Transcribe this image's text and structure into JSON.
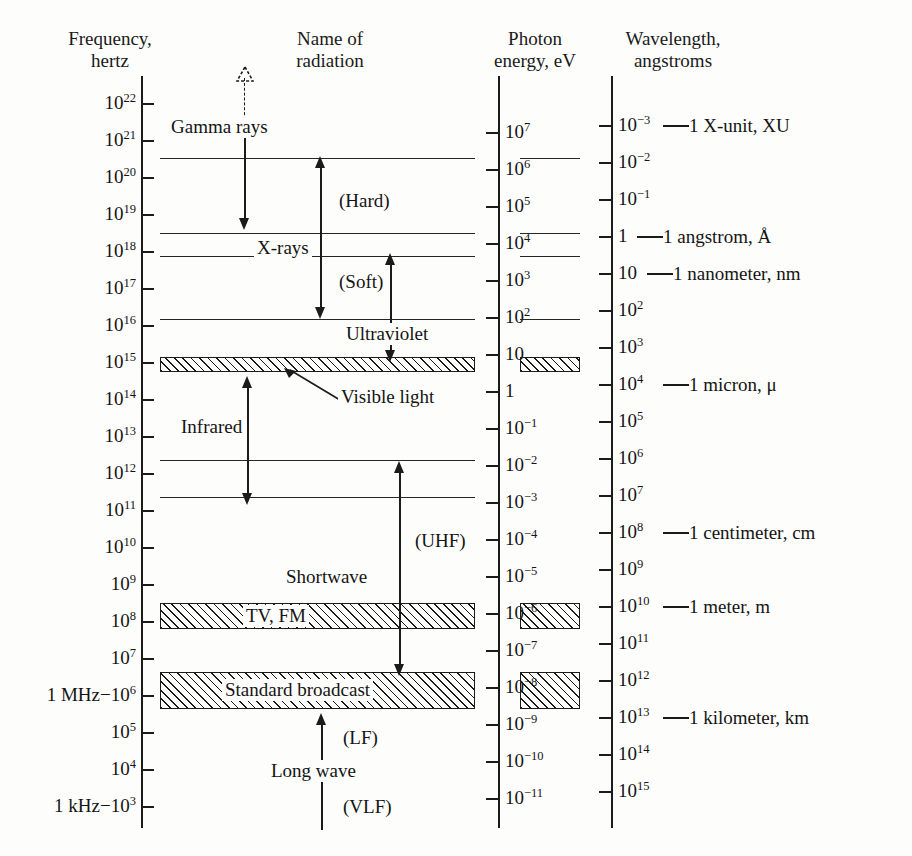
{
  "figure": {
    "background_color": "#fdfdfb",
    "ink_color": "#1b1b1b"
  },
  "columns": {
    "frequency": {
      "line1": "Frequency,",
      "line2": "hertz"
    },
    "name": {
      "line1": "Name of",
      "line2": "radiation"
    },
    "photon": {
      "line1": "Photon",
      "line2": "energy, eV"
    },
    "wavelength": {
      "line1": "Wavelength,",
      "line2": "angstroms"
    }
  },
  "frequency_axis": {
    "ticks": [
      {
        "label": "10",
        "exp": "22",
        "decade": 22
      },
      {
        "label": "10",
        "exp": "21",
        "decade": 21
      },
      {
        "label": "10",
        "exp": "20",
        "decade": 20
      },
      {
        "label": "10",
        "exp": "19",
        "decade": 19
      },
      {
        "label": "10",
        "exp": "18",
        "decade": 18
      },
      {
        "label": "10",
        "exp": "17",
        "decade": 17
      },
      {
        "label": "10",
        "exp": "16",
        "decade": 16
      },
      {
        "label": "10",
        "exp": "15",
        "decade": 15
      },
      {
        "label": "10",
        "exp": "14",
        "decade": 14
      },
      {
        "label": "10",
        "exp": "13",
        "decade": 13
      },
      {
        "label": "10",
        "exp": "12",
        "decade": 12
      },
      {
        "label": "10",
        "exp": "11",
        "decade": 11
      },
      {
        "label": "10",
        "exp": "10",
        "decade": 10
      },
      {
        "label": "10",
        "exp": "9",
        "decade": 9
      },
      {
        "label": "10",
        "exp": "8",
        "decade": 8
      },
      {
        "label": "10",
        "exp": "7",
        "decade": 7
      },
      {
        "label": "1 MHz−10",
        "exp": "6",
        "decade": 6
      },
      {
        "label": "10",
        "exp": "5",
        "decade": 5
      },
      {
        "label": "10",
        "exp": "4",
        "decade": 4
      },
      {
        "label": "1 kHz−10",
        "exp": "3",
        "decade": 3
      }
    ]
  },
  "photon_axis": {
    "ticks": [
      {
        "label": "10",
        "exp": "7"
      },
      {
        "label": "10",
        "exp": "6"
      },
      {
        "label": "10",
        "exp": "5"
      },
      {
        "label": "10",
        "exp": "4"
      },
      {
        "label": "10",
        "exp": "3"
      },
      {
        "label": "10",
        "exp": "2"
      },
      {
        "label": "10",
        "exp": ""
      },
      {
        "label": "1",
        "exp": ""
      },
      {
        "label": "10",
        "exp": "−1"
      },
      {
        "label": "10",
        "exp": "−2"
      },
      {
        "label": "10",
        "exp": "−3"
      },
      {
        "label": "10",
        "exp": "−4"
      },
      {
        "label": "10",
        "exp": "−5"
      },
      {
        "label": "10",
        "exp": "−6"
      },
      {
        "label": "10",
        "exp": "−7"
      },
      {
        "label": "10",
        "exp": "−8"
      },
      {
        "label": "10",
        "exp": "−9"
      },
      {
        "label": "10",
        "exp": "−10"
      },
      {
        "label": "10",
        "exp": "−11"
      }
    ]
  },
  "wavelength_axis": {
    "ticks": [
      {
        "label": "10",
        "exp": "−3",
        "unit": "1 X-unit, XU"
      },
      {
        "label": "10",
        "exp": "−2",
        "unit": ""
      },
      {
        "label": "10",
        "exp": "−1",
        "unit": ""
      },
      {
        "label": "1",
        "exp": "",
        "unit": "1 angstrom, Å"
      },
      {
        "label": "10",
        "exp": "",
        "unit": "1 nanometer, nm"
      },
      {
        "label": "10",
        "exp": "2",
        "unit": ""
      },
      {
        "label": "10",
        "exp": "3",
        "unit": ""
      },
      {
        "label": "10",
        "exp": "4",
        "unit": "1 micron, μ"
      },
      {
        "label": "10",
        "exp": "5",
        "unit": ""
      },
      {
        "label": "10",
        "exp": "6",
        "unit": ""
      },
      {
        "label": "10",
        "exp": "7",
        "unit": ""
      },
      {
        "label": "10",
        "exp": "8",
        "unit": "1 centimeter, cm"
      },
      {
        "label": "10",
        "exp": "9",
        "unit": ""
      },
      {
        "label": "10",
        "exp": "10",
        "unit": "1 meter, m"
      },
      {
        "label": "10",
        "exp": "11",
        "unit": ""
      },
      {
        "label": "10",
        "exp": "12",
        "unit": ""
      },
      {
        "label": "10",
        "exp": "13",
        "unit": "1 kilometer, km"
      },
      {
        "label": "10",
        "exp": "14",
        "unit": ""
      },
      {
        "label": "10",
        "exp": "15",
        "unit": ""
      }
    ]
  },
  "radiation_labels": {
    "gamma": "Gamma rays",
    "hard": "(Hard)",
    "xrays": "X-rays",
    "soft": "(Soft)",
    "ultraviolet": "Ultraviolet",
    "visible": "Visible light",
    "infrared": "Infrared",
    "uhf": "(UHF)",
    "shortwave": "Shortwave",
    "tvfm": "TV, FM",
    "broadcast": "Standard broadcast",
    "lf": "(LF)",
    "longwave": "Long wave",
    "vlf": "(VLF)"
  },
  "chart_data": {
    "type": "table",
    "axes": [
      {
        "name": "Frequency",
        "unit": "hertz",
        "range_log10": [
          3,
          22
        ],
        "direction": "high at top"
      },
      {
        "name": "Photon energy",
        "unit": "eV",
        "range_log10": [
          -11,
          7
        ],
        "direction": "high at top"
      },
      {
        "name": "Wavelength",
        "unit": "angstroms",
        "range_log10": [
          -3,
          15
        ],
        "direction": "short at top"
      }
    ],
    "bands": [
      {
        "name": "Gamma rays",
        "freq_hz_log10_top": 22.6,
        "freq_hz_log10_bottom": 20.4,
        "note": "open dashed arrow upward (no upper limit)"
      },
      {
        "name": "X-rays (Hard)",
        "freq_hz_log10_top": 20.4,
        "freq_hz_log10_bottom": 18.3
      },
      {
        "name": "X-rays (Soft)",
        "freq_hz_log10_top": 18.3,
        "freq_hz_log10_bottom": 16.2
      },
      {
        "name": "Ultraviolet",
        "freq_hz_log10_top": 17.7,
        "freq_hz_log10_bottom": 14.9
      },
      {
        "name": "Visible light",
        "freq_hz_log10_top": 15.0,
        "freq_hz_log10_bottom": 14.7,
        "hatched": true
      },
      {
        "name": "Infrared",
        "freq_hz_log10_top": 14.7,
        "freq_hz_log10_bottom": 11.1
      },
      {
        "name": "Shortwave (UHF)",
        "freq_hz_log10_top": 12.1,
        "freq_hz_log10_bottom": 6.6
      },
      {
        "name": "TV, FM",
        "freq_hz_log10_top": 8.5,
        "freq_hz_log10_bottom": 7.8,
        "hatched": true
      },
      {
        "name": "Standard broadcast",
        "freq_hz_log10_top": 6.6,
        "freq_hz_log10_bottom": 5.6,
        "hatched": true
      },
      {
        "name": "Long wave (LF / VLF)",
        "freq_hz_log10_top": 5.6,
        "freq_hz_log10_bottom": 2.6
      }
    ],
    "unit_markers": [
      {
        "wavelength_angstrom_log10": -3,
        "label": "1 X-unit, XU"
      },
      {
        "wavelength_angstrom_log10": 0,
        "label": "1 angstrom, Å"
      },
      {
        "wavelength_angstrom_log10": 1,
        "label": "1 nanometer, nm"
      },
      {
        "wavelength_angstrom_log10": 4,
        "label": "1 micron, μ"
      },
      {
        "wavelength_angstrom_log10": 8,
        "label": "1 centimeter, cm"
      },
      {
        "wavelength_angstrom_log10": 10,
        "label": "1 meter, m"
      },
      {
        "wavelength_angstrom_log10": 13,
        "label": "1 kilometer, km"
      }
    ],
    "frequency_markers": [
      {
        "freq_hz_log10": 6,
        "label": "1 MHz"
      },
      {
        "freq_hz_log10": 3,
        "label": "1 kHz"
      }
    ]
  }
}
